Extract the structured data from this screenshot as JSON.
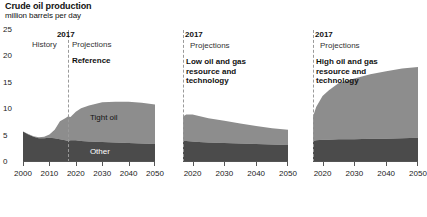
{
  "header": {
    "title": "Crude oil production",
    "subtitle": "million barrels per day"
  },
  "axis": {
    "y_ticks": [
      "25",
      "20",
      "15",
      "10",
      "5",
      "0"
    ],
    "y_values": [
      25,
      20,
      15,
      10,
      5,
      0
    ]
  },
  "panels": [
    {
      "id": "reference",
      "year_marker": "2017",
      "history_label": "History",
      "projections_label": "Projections",
      "scenario_label": "Reference",
      "x_ticks": [
        "2000",
        "2010",
        "2020",
        "2030",
        "2040",
        "2050"
      ],
      "series_labels": {
        "tight": "Tight oil",
        "other": "Other"
      }
    },
    {
      "id": "low-resource",
      "year_marker": "2017",
      "projections_label": "Projections",
      "scenario_label": "Low oil and gas resource and technology",
      "x_ticks": [
        "2020",
        "2030",
        "2040",
        "2050"
      ]
    },
    {
      "id": "high-resource",
      "year_marker": "2017",
      "projections_label": "Projections",
      "scenario_label": "High oil and gas resource and technology",
      "x_ticks": [
        "2020",
        "2030",
        "2040",
        "2050"
      ]
    }
  ],
  "colors": {
    "tight_oil": "#8d8d8d",
    "other": "#4b4b4b",
    "axis": "#555555",
    "divider": "#9a9a9a",
    "background": "#ffffff"
  },
  "chart_data": {
    "type": "area",
    "title": "Crude oil production",
    "ylabel": "million barrels per day",
    "xlabel": "",
    "ylim": [
      0,
      25
    ],
    "grid": false,
    "legend": "in-plot labels",
    "stacked": true,
    "series_names": [
      "Other",
      "Tight oil"
    ],
    "panels": [
      {
        "name": "Reference",
        "xlim": [
          2000,
          2050
        ],
        "history_projection_split": 2017,
        "x": [
          2000,
          2002,
          2004,
          2006,
          2008,
          2010,
          2012,
          2014,
          2016,
          2017,
          2018,
          2020,
          2022,
          2025,
          2030,
          2035,
          2040,
          2045,
          2050
        ],
        "series": [
          {
            "name": "Other",
            "values": [
              5.8,
              5.2,
              4.8,
              4.5,
              4.5,
              4.6,
              4.5,
              4.3,
              4.1,
              4.0,
              4.1,
              4.1,
              4.0,
              3.9,
              3.8,
              3.7,
              3.6,
              3.5,
              3.4
            ]
          },
          {
            "name": "Tight oil",
            "values": [
              0.0,
              0.1,
              0.1,
              0.2,
              0.3,
              0.6,
              1.6,
              3.4,
              4.2,
              4.6,
              4.4,
              5.4,
              6.2,
              6.8,
              7.5,
              7.7,
              7.8,
              7.7,
              7.5
            ]
          }
        ],
        "total": [
          5.8,
          5.3,
          4.9,
          4.7,
          4.8,
          5.2,
          6.1,
          7.7,
          8.3,
          8.6,
          8.5,
          9.5,
          10.2,
          10.7,
          11.3,
          11.4,
          11.4,
          11.2,
          10.9
        ]
      },
      {
        "name": "Low oil and gas resource and technology",
        "xlim": [
          2017,
          2050
        ],
        "history_projection_split": 2017,
        "x": [
          2017,
          2018,
          2020,
          2022,
          2025,
          2030,
          2035,
          2040,
          2045,
          2050
        ],
        "series": [
          {
            "name": "Other",
            "values": [
              4.0,
              4.0,
              3.9,
              3.8,
              3.7,
              3.6,
              3.5,
              3.4,
              3.3,
              3.2
            ]
          },
          {
            "name": "Tight oil",
            "values": [
              4.6,
              5.0,
              5.1,
              4.9,
              4.6,
              4.2,
              3.8,
              3.4,
              3.1,
              2.9
            ]
          }
        ],
        "total": [
          8.6,
          9.0,
          9.0,
          8.7,
          8.3,
          7.8,
          7.3,
          6.8,
          6.4,
          6.1
        ]
      },
      {
        "name": "High oil and gas resource and technology",
        "xlim": [
          2017,
          2050
        ],
        "history_projection_split": 2017,
        "x": [
          2017,
          2018,
          2020,
          2022,
          2025,
          2030,
          2035,
          2040,
          2045,
          2050
        ],
        "series": [
          {
            "name": "Other",
            "values": [
              4.0,
              4.1,
              4.2,
              4.2,
              4.3,
              4.3,
              4.4,
              4.4,
              4.5,
              4.6
            ]
          },
          {
            "name": "Tight oil",
            "values": [
              4.6,
              6.3,
              8.3,
              9.4,
              10.6,
              11.5,
              12.2,
              12.8,
              13.2,
              13.4
            ]
          }
        ],
        "total": [
          8.6,
          10.4,
          12.5,
          13.6,
          14.9,
          15.8,
          16.6,
          17.2,
          17.7,
          18.0
        ]
      }
    ]
  }
}
